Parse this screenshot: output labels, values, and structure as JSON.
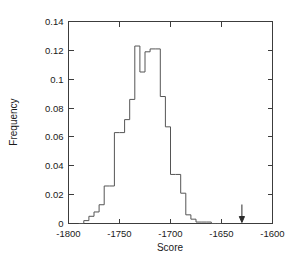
{
  "chart_data": {
    "type": "bar",
    "subtype": "histogram-step",
    "title": "",
    "xlabel": "Score",
    "ylabel": "Frequency",
    "xlim": [
      -1800,
      -1600
    ],
    "ylim": [
      0,
      0.14
    ],
    "xticks": [
      -1800,
      -1750,
      -1700,
      -1650,
      -1600
    ],
    "xtick_labels": [
      "-1800",
      "-1750",
      "-1700",
      "-1650",
      "-1600"
    ],
    "yticks": [
      0,
      0.02,
      0.04,
      0.06,
      0.08,
      0.1,
      0.12,
      0.14
    ],
    "ytick_labels": [
      "0",
      "0.02",
      "0.04",
      "0.06",
      "0.08",
      "0.1",
      "0.12",
      "0.14"
    ],
    "grid": false,
    "legend": null,
    "bin_width": 5,
    "bin_edges": [
      -1790,
      -1785,
      -1780,
      -1775,
      -1770,
      -1765,
      -1760,
      -1755,
      -1750,
      -1745,
      -1740,
      -1735,
      -1730,
      -1725,
      -1720,
      -1715,
      -1710,
      -1705,
      -1700,
      -1695,
      -1690,
      -1685,
      -1680,
      -1675,
      -1670,
      -1665,
      -1660,
      -1655,
      -1650
    ],
    "bin_centers": [
      -1787.5,
      -1782.5,
      -1777.5,
      -1772.5,
      -1767.5,
      -1762.5,
      -1757.5,
      -1752.5,
      -1747.5,
      -1742.5,
      -1737.5,
      -1732.5,
      -1727.5,
      -1722.5,
      -1717.5,
      -1712.5,
      -1707.5,
      -1702.5,
      -1697.5,
      -1692.5,
      -1687.5,
      -1682.5,
      -1677.5,
      -1672.5,
      -1667.5,
      -1662.5,
      -1657.5,
      -1652.5
    ],
    "values": [
      0.0,
      0.002,
      0.005,
      0.008,
      0.013,
      0.026,
      0.026,
      0.063,
      0.063,
      0.072,
      0.086,
      0.123,
      0.105,
      0.119,
      0.121,
      0.121,
      0.088,
      0.067,
      0.034,
      0.034,
      0.021,
      0.006,
      0.003,
      0.001,
      0.001,
      0.001,
      0.0,
      0.0
    ],
    "annotations": [
      {
        "name": "score-marker-arrow",
        "glyph": "down-arrow",
        "x": -1630,
        "y": 0.0,
        "label": ""
      }
    ],
    "colors": {
      "line": "#555555",
      "axis": "#3c3c3c",
      "marker": "#2b2b2b",
      "background": "#ffffff"
    }
  }
}
